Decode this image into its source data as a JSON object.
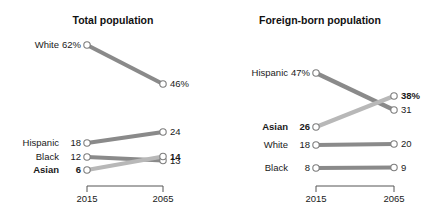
{
  "figure": {
    "background_color": "#ffffff",
    "text_color": "#1a1a1a"
  },
  "colors": {
    "line_dark": "#8a8a8a",
    "line_light": "#b8b8b8",
    "marker_fill": "#ffffff",
    "marker_stroke": "#7d7d7d",
    "bracket": "#555555",
    "title": "#111111"
  },
  "axis": {
    "year_start": "2015",
    "year_end": "2065",
    "x_left_px": 87,
    "x_right_px": 163
  },
  "panels": [
    {
      "id": "total-population",
      "title": "Total population",
      "title_x": 113,
      "x_left": 87,
      "x_right": 163,
      "bracket_y": 186,
      "year_label_y": 202,
      "year_start": "2015",
      "year_end": "2065",
      "series": [
        {
          "name": "White",
          "label": "White",
          "label_bold": false,
          "start_value": 62,
          "end_value": 46,
          "start_label": "62%",
          "end_label": "46%",
          "start_bold": false,
          "end_bold": false,
          "start_y": 45,
          "end_y": 84,
          "color": "line_dark",
          "width": 4.2
        },
        {
          "name": "Hispanic",
          "label": "Hispanic",
          "label_bold": false,
          "start_value": 18,
          "end_value": 24,
          "start_label": "18",
          "end_label": "24",
          "start_bold": false,
          "end_bold": false,
          "start_y": 143,
          "end_y": 132,
          "color": "line_dark",
          "width": 4.2
        },
        {
          "name": "Black",
          "label": "Black",
          "label_bold": false,
          "start_value": 12,
          "end_value": 13,
          "start_label": "12",
          "end_label": "13",
          "start_bold": false,
          "end_bold": false,
          "start_y": 157,
          "end_y": 160.5,
          "color": "line_dark",
          "width": 4.2
        },
        {
          "name": "Asian",
          "label": "Asian",
          "label_bold": true,
          "start_value": 6,
          "end_value": 14,
          "start_label": "6",
          "end_label": "14",
          "start_bold": true,
          "end_bold": true,
          "start_y": 170,
          "end_y": 156.5,
          "color": "line_light",
          "width": 4.2
        }
      ]
    },
    {
      "id": "foreign-born-population",
      "title": "Foreign-born population",
      "title_x": 320,
      "x_left": 316,
      "x_right": 394,
      "bracket_y": 186,
      "year_label_y": 202,
      "year_start": "2015",
      "year_end": "2065",
      "series": [
        {
          "name": "Hispanic",
          "label": "Hispanic",
          "label_bold": false,
          "start_value": 47,
          "end_value": 31,
          "start_label": "47%",
          "end_label": "31",
          "start_bold": false,
          "end_bold": false,
          "start_y": 73,
          "end_y": 110,
          "color": "line_dark",
          "width": 4.2
        },
        {
          "name": "Asian",
          "label": "Asian",
          "label_bold": true,
          "start_value": 26,
          "end_value": 38,
          "start_label": "26",
          "end_label": "38%",
          "start_bold": true,
          "end_bold": true,
          "start_y": 127,
          "end_y": 96,
          "color": "line_light",
          "width": 4.2
        },
        {
          "name": "White",
          "label": "White",
          "label_bold": false,
          "start_value": 18,
          "end_value": 20,
          "start_label": "18",
          "end_label": "20",
          "start_bold": false,
          "end_bold": false,
          "start_y": 145,
          "end_y": 144,
          "color": "line_dark",
          "width": 4.2
        },
        {
          "name": "Black",
          "label": "Black",
          "label_bold": false,
          "start_value": 8,
          "end_value": 9,
          "start_label": "8",
          "end_label": "9",
          "start_bold": false,
          "end_bold": false,
          "start_y": 168,
          "end_y": 167.5,
          "color": "line_dark",
          "width": 4.2
        }
      ]
    }
  ],
  "chart_data": {
    "type": "line",
    "subtype": "slopegraph",
    "title": "",
    "xlabel": "",
    "ylabel": "",
    "x": [
      "2015",
      "2065"
    ],
    "grid": false,
    "legend": "none",
    "value_unit": "percent",
    "panels": [
      {
        "title": "Total population",
        "categories": [
          "White",
          "Hispanic",
          "Black",
          "Asian"
        ],
        "series": [
          {
            "name": "White",
            "values": [
              62,
              46
            ],
            "labels": [
              "62%",
              "46%"
            ]
          },
          {
            "name": "Hispanic",
            "values": [
              18,
              24
            ],
            "labels": [
              "18",
              "24"
            ]
          },
          {
            "name": "Black",
            "values": [
              12,
              13
            ],
            "labels": [
              "12",
              "13"
            ]
          },
          {
            "name": "Asian",
            "values": [
              6,
              14
            ],
            "labels": [
              "6",
              "14"
            ],
            "highlight": true
          }
        ]
      },
      {
        "title": "Foreign-born population",
        "categories": [
          "Hispanic",
          "Asian",
          "White",
          "Black"
        ],
        "series": [
          {
            "name": "Hispanic",
            "values": [
              47,
              31
            ],
            "labels": [
              "47%",
              "31"
            ]
          },
          {
            "name": "Asian",
            "values": [
              26,
              38
            ],
            "labels": [
              "26",
              "38%"
            ],
            "highlight": true
          },
          {
            "name": "White",
            "values": [
              18,
              20
            ],
            "labels": [
              "18",
              "20"
            ]
          },
          {
            "name": "Black",
            "values": [
              8,
              9
            ],
            "labels": [
              "8",
              "9"
            ]
          }
        ]
      }
    ]
  }
}
